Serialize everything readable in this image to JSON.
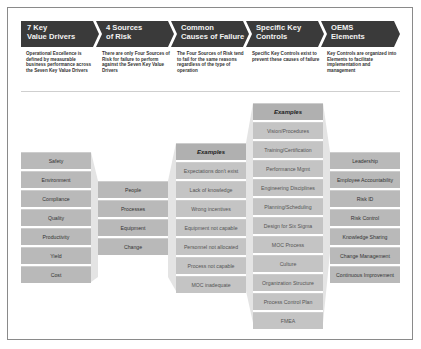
{
  "header": {
    "steps": [
      {
        "line1": "7 Key",
        "line2": "Value Drivers",
        "description": "Operational Excellence is defined by measurable business performance across the Seven Key Value Drivers"
      },
      {
        "line1": "4 Sources",
        "line2": "of Risk",
        "description": "There are only Four Sources of Risk for failure to perform against the Seven Key Value Drivers"
      },
      {
        "line1": "Common",
        "line2": "Causes of Failure",
        "description": "The Four Sources of Risk tend to fail for the same reasons regardless of the type of operation"
      },
      {
        "line1": "Specific Key",
        "line2": "Controls",
        "description": "Specific Key Controls exist to prevent these causes of failure"
      },
      {
        "line1": "OEMS",
        "line2": "Elements",
        "description": "Key Controls are organized into Elements to facilitate implementation and management"
      }
    ]
  },
  "columns": {
    "value_drivers": [
      "Safety",
      "Environment",
      "Compliance",
      "Quality",
      "Productivity",
      "Yield",
      "Cost"
    ],
    "sources_of_risk": [
      "People",
      "Processes",
      "Equipment",
      "Change"
    ],
    "causes_of_failure": {
      "header": "Examples",
      "items": [
        "Expectations don't exist",
        "Lack of knowledge",
        "Wrong incentives",
        "Equipment not capable",
        "Personnel not allocated",
        "Process not capable",
        "MOC inadequate"
      ]
    },
    "key_controls": {
      "header": "Examples",
      "items": [
        "Vision/Procedures",
        "Training/Certification",
        "Performance Mgmt",
        "Engineering Disciplines",
        "Planning/Scheduling",
        "Design for Six Sigma",
        "MOC Process",
        "Culture",
        "Organization Structure",
        "Process Control Plan",
        "FMEA"
      ]
    },
    "oems_elements": [
      "Leadership",
      "Employee Accountability",
      "Risk ID",
      "Risk Control",
      "Knowledge Sharing",
      "Change Management",
      "Continuous Improvement"
    ]
  },
  "colors": {
    "chevron": "#3a3a3a",
    "cell": "#b9b9b9",
    "funnel": "#e4e4e4"
  }
}
